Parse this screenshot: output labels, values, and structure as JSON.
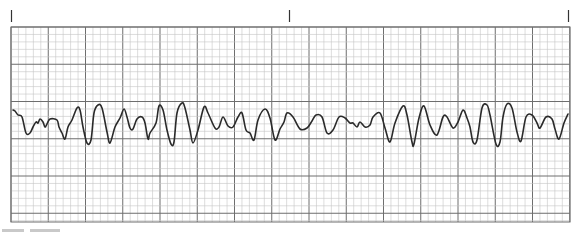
{
  "figure": {
    "kind": "ECG rhythm strip",
    "grid_color_minor": "#c4c4c4",
    "grid_color_major": "#6e6e6e",
    "trace_color": "#2a2a2a",
    "tick_marks": 3,
    "caption_visible": false
  },
  "trace": {
    "description": "Irregular chaotic waveform with varying amplitude (polymorphic pattern)",
    "points": [
      [
        13,
        110
      ],
      [
        15,
        111
      ],
      [
        18,
        115
      ],
      [
        22,
        117
      ],
      [
        26,
        133
      ],
      [
        30,
        133
      ],
      [
        33,
        127
      ],
      [
        36,
        122
      ],
      [
        38,
        123
      ],
      [
        40,
        119
      ],
      [
        43,
        122
      ],
      [
        45,
        127
      ],
      [
        47,
        124
      ],
      [
        50,
        119
      ],
      [
        57,
        120
      ],
      [
        59,
        127
      ],
      [
        62,
        133
      ],
      [
        65,
        139
      ],
      [
        68,
        127
      ],
      [
        72,
        120
      ],
      [
        77,
        108
      ],
      [
        80,
        110
      ],
      [
        83,
        127
      ],
      [
        87,
        143
      ],
      [
        91,
        140
      ],
      [
        94,
        113
      ],
      [
        98,
        105
      ],
      [
        102,
        108
      ],
      [
        107,
        132
      ],
      [
        110,
        143
      ],
      [
        115,
        127
      ],
      [
        120,
        118
      ],
      [
        124,
        109
      ],
      [
        127,
        117
      ],
      [
        130,
        128
      ],
      [
        133,
        129
      ],
      [
        137,
        119
      ],
      [
        142,
        117
      ],
      [
        145,
        123
      ],
      [
        148,
        139
      ],
      [
        150,
        133
      ],
      [
        156,
        123
      ],
      [
        159,
        106
      ],
      [
        163,
        110
      ],
      [
        167,
        130
      ],
      [
        171,
        144
      ],
      [
        174,
        142
      ],
      [
        177,
        113
      ],
      [
        182,
        103
      ],
      [
        185,
        108
      ],
      [
        190,
        130
      ],
      [
        193,
        143
      ],
      [
        198,
        130
      ],
      [
        204,
        107
      ],
      [
        208,
        113
      ],
      [
        215,
        128
      ],
      [
        219,
        127
      ],
      [
        223,
        117
      ],
      [
        228,
        126
      ],
      [
        233,
        127
      ],
      [
        238,
        117
      ],
      [
        242,
        113
      ],
      [
        246,
        130
      ],
      [
        250,
        133
      ],
      [
        254,
        140
      ],
      [
        258,
        120
      ],
      [
        265,
        109
      ],
      [
        270,
        118
      ],
      [
        275,
        140
      ],
      [
        280,
        129
      ],
      [
        284,
        122
      ],
      [
        287,
        113
      ],
      [
        293,
        117
      ],
      [
        300,
        129
      ],
      [
        307,
        128
      ],
      [
        312,
        121
      ],
      [
        316,
        115
      ],
      [
        322,
        117
      ],
      [
        327,
        133
      ],
      [
        333,
        130
      ],
      [
        339,
        117
      ],
      [
        345,
        118
      ],
      [
        350,
        123
      ],
      [
        353,
        123
      ],
      [
        357,
        127
      ],
      [
        360,
        122
      ],
      [
        365,
        127
      ],
      [
        370,
        125
      ],
      [
        373,
        117
      ],
      [
        380,
        113
      ],
      [
        385,
        128
      ],
      [
        390,
        142
      ],
      [
        395,
        123
      ],
      [
        403,
        106
      ],
      [
        407,
        115
      ],
      [
        412,
        142
      ],
      [
        414,
        144
      ],
      [
        419,
        118
      ],
      [
        424,
        106
      ],
      [
        430,
        125
      ],
      [
        437,
        135
      ],
      [
        443,
        117
      ],
      [
        447,
        117
      ],
      [
        453,
        128
      ],
      [
        458,
        122
      ],
      [
        463,
        110
      ],
      [
        467,
        118
      ],
      [
        470,
        127
      ],
      [
        473,
        142
      ],
      [
        477,
        140
      ],
      [
        482,
        108
      ],
      [
        487,
        105
      ],
      [
        490,
        115
      ],
      [
        496,
        144
      ],
      [
        500,
        142
      ],
      [
        503,
        117
      ],
      [
        507,
        104
      ],
      [
        512,
        108
      ],
      [
        517,
        132
      ],
      [
        521,
        141
      ],
      [
        526,
        117
      ],
      [
        532,
        115
      ],
      [
        537,
        123
      ],
      [
        540,
        128
      ],
      [
        546,
        117
      ],
      [
        552,
        119
      ],
      [
        555,
        129
      ],
      [
        559,
        139
      ],
      [
        564,
        123
      ],
      [
        568,
        114
      ]
    ]
  }
}
